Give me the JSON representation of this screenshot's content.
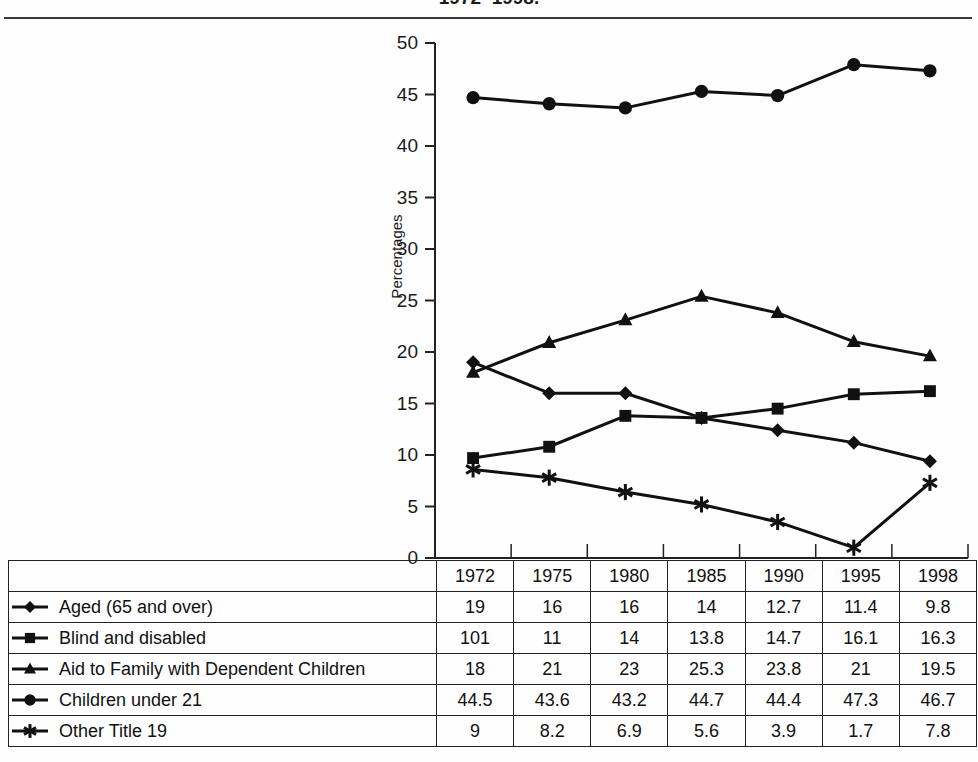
{
  "title": "1972–1998.",
  "axis": {
    "ylabel": "Percentages",
    "yticks": [
      "0",
      "5",
      "10",
      "15",
      "20",
      "25",
      "30",
      "35",
      "40",
      "45",
      "50"
    ]
  },
  "table": {
    "years": [
      "1972",
      "1975",
      "1980",
      "1985",
      "1990",
      "1995",
      "1998"
    ],
    "rows": [
      {
        "label": "Aged (65 and over)",
        "marker": "diamond-marker-icon",
        "values": [
          "19",
          "16",
          "16",
          "14",
          "12.7",
          "11.4",
          "9.8"
        ]
      },
      {
        "label": "Blind and disabled",
        "marker": "square-marker-icon",
        "values": [
          "101",
          "11",
          "14",
          "13.8",
          "14.7",
          "16.1",
          "16.3"
        ]
      },
      {
        "label": "Aid to Family with Dependent Children",
        "marker": "triangle-marker-icon",
        "values": [
          "18",
          "21",
          "23",
          "25.3",
          "23.8",
          "21",
          "19.5"
        ]
      },
      {
        "label": "Children under 21",
        "marker": "circle-marker-icon",
        "values": [
          "44.5",
          "43.6",
          "43.2",
          "44.7",
          "44.4",
          "47.3",
          "46.7"
        ]
      },
      {
        "label": "Other Title 19",
        "marker": "star-marker-icon",
        "values": [
          "9",
          "8.2",
          "6.9",
          "5.6",
          "3.9",
          "1.7",
          "7.8"
        ]
      }
    ]
  },
  "chart_data": {
    "type": "line",
    "title": "1972–1998.",
    "xlabel": "",
    "ylabel": "Percentages",
    "ylim": [
      0,
      50
    ],
    "ytick_step": 5,
    "grid": false,
    "legend_position": "table-below",
    "categories": [
      "1972",
      "1975",
      "1980",
      "1985",
      "1990",
      "1995",
      "1998"
    ],
    "series": [
      {
        "name": "Aged (65 and over)",
        "marker": "diamond",
        "color": "#111111",
        "values": [
          19,
          16,
          16,
          14,
          12.7,
          11.4,
          9.8
        ],
        "plotted_values": [
          19,
          16,
          16,
          13.6,
          12.4,
          11.2,
          9.4
        ]
      },
      {
        "name": "Blind and disabled",
        "marker": "square",
        "color": "#111111",
        "values": [
          101,
          11,
          14,
          13.8,
          14.7,
          16.1,
          16.3
        ],
        "plotted_values": [
          9.7,
          10.8,
          13.8,
          13.6,
          14.5,
          15.9,
          16.2
        ]
      },
      {
        "name": "Aid to Family with Dependent Children",
        "marker": "triangle",
        "color": "#111111",
        "values": [
          18,
          21,
          23,
          25.3,
          23.8,
          21,
          19.5
        ],
        "plotted_values": [
          18,
          20.9,
          23.1,
          25.4,
          23.8,
          21,
          19.6
        ]
      },
      {
        "name": "Children under 21",
        "marker": "circle",
        "color": "#111111",
        "values": [
          44.5,
          43.6,
          43.2,
          44.7,
          44.4,
          47.3,
          46.7
        ],
        "plotted_values": [
          44.7,
          44.1,
          43.7,
          45.3,
          44.9,
          47.9,
          47.3
        ]
      },
      {
        "name": "Other Title 19",
        "marker": "star",
        "color": "#111111",
        "values": [
          9,
          8.2,
          6.9,
          5.6,
          3.9,
          1.7,
          7.8
        ],
        "plotted_values": [
          8.6,
          7.8,
          6.4,
          5.2,
          3.5,
          1.0,
          7.3
        ]
      }
    ]
  }
}
